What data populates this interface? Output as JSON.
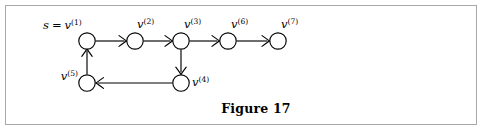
{
  "figure": {
    "caption": "Figure 17",
    "border_color": "#a8a8a8",
    "background_color": "#ffffff",
    "ink_color": "#000000"
  },
  "graph": {
    "type": "directed-graph",
    "source_label_prefix": "s = ",
    "nodes": [
      {
        "id": "v1",
        "label_base": "v",
        "label_sup": "(1)",
        "label_full": "v(1)",
        "cx": 81,
        "cy": 35,
        "r": 8.2,
        "label_x": 37,
        "label_y": 23,
        "label_anchor": "start",
        "source": true
      },
      {
        "id": "v2",
        "label_base": "v",
        "label_sup": "(2)",
        "label_full": "v(2)",
        "cx": 129,
        "cy": 35,
        "r": 8.2,
        "label_x": 131,
        "label_y": 22,
        "label_anchor": "start",
        "source": false
      },
      {
        "id": "v3",
        "label_base": "v",
        "label_sup": "(3)",
        "label_full": "v(3)",
        "cx": 175,
        "cy": 35,
        "r": 8.2,
        "label_x": 178,
        "label_y": 22,
        "label_anchor": "start",
        "source": false
      },
      {
        "id": "v6",
        "label_base": "v",
        "label_sup": "(6)",
        "label_full": "v(6)",
        "cx": 222,
        "cy": 35,
        "r": 8.2,
        "label_x": 225,
        "label_y": 22,
        "label_anchor": "start",
        "source": false
      },
      {
        "id": "v7",
        "label_base": "v",
        "label_sup": "(7)",
        "label_full": "v(7)",
        "cx": 272,
        "cy": 35,
        "r": 8.2,
        "label_x": 275,
        "label_y": 22,
        "label_anchor": "start",
        "source": false
      },
      {
        "id": "v4",
        "label_base": "v",
        "label_sup": "(4)",
        "label_full": "v(4)",
        "cx": 175,
        "cy": 77,
        "r": 8.2,
        "label_x": 186,
        "label_y": 80,
        "label_anchor": "start",
        "source": false
      },
      {
        "id": "v5",
        "label_base": "v",
        "label_sup": "(5)",
        "label_full": "v(5)",
        "cx": 81,
        "cy": 77,
        "r": 8.2,
        "label_x": 72,
        "label_y": 74,
        "label_anchor": "end",
        "source": false
      }
    ],
    "edges": [
      {
        "id": "e1",
        "from": "v1",
        "to": "v2",
        "direction": "right"
      },
      {
        "id": "e2",
        "from": "v2",
        "to": "v3",
        "direction": "right"
      },
      {
        "id": "e3",
        "from": "v3",
        "to": "v6",
        "direction": "right"
      },
      {
        "id": "e4",
        "from": "v6",
        "to": "v7",
        "direction": "right"
      },
      {
        "id": "e5",
        "from": "v3",
        "to": "v4",
        "direction": "down"
      },
      {
        "id": "e6",
        "from": "v4",
        "to": "v5",
        "direction": "left"
      },
      {
        "id": "e7",
        "from": "v5",
        "to": "v1",
        "direction": "up"
      }
    ]
  },
  "caption_position": {
    "x": 250,
    "y": 107
  }
}
